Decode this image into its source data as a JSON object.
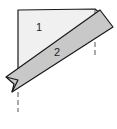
{
  "diagram": {
    "panels": [
      {
        "id": "panel-1",
        "label": "1",
        "fill": "#f0f0f0"
      },
      {
        "id": "strip-2",
        "label": "2",
        "fill": "#c8c8c8"
      }
    ],
    "colors": {
      "outline": "#1a1a1a",
      "dashed_line": "#555555",
      "background": "#ffffff"
    },
    "guides": [
      {
        "id": "left-fold-guide",
        "style": "dashed",
        "orientation": "vertical"
      },
      {
        "id": "right-fold-guide",
        "style": "dashed",
        "orientation": "vertical"
      }
    ]
  }
}
